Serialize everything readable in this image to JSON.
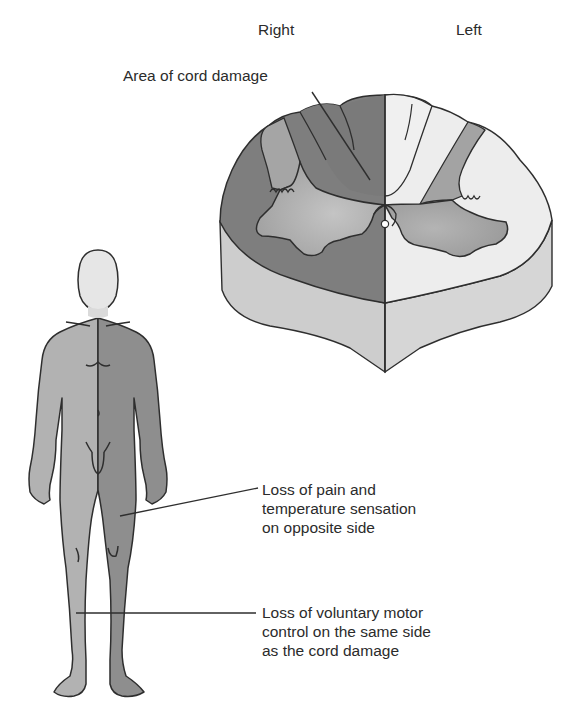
{
  "figure": {
    "colors": {
      "dark_gray": "#7c7c7c",
      "medium_gray": "#a9a9a9",
      "light_gray": "#cfcfcf",
      "very_light": "#ececec",
      "outline": "#2e2e2e",
      "background": "#ffffff"
    }
  },
  "cord": {
    "side_labels": {
      "right": "Right",
      "left": "Left"
    },
    "damage_label": "Area of cord damage"
  },
  "body": {
    "callouts": [
      {
        "id": "pain-temp",
        "lines": [
          "Loss of pain and",
          "temperature sensation",
          "on opposite side"
        ]
      },
      {
        "id": "motor",
        "lines": [
          "Loss of voluntary motor",
          "control on the same side",
          "as the cord damage"
        ]
      }
    ]
  }
}
